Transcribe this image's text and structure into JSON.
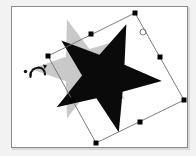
{
  "app": {
    "title": "Rotate Shape Canvas",
    "tool_mode": "Rotate",
    "canvas_background": "#ffffff",
    "page_background": "#f2f2f2",
    "frame_border_color": "#8a8a8a"
  },
  "canvas": {
    "width": 177,
    "height": 142,
    "label": "Drawing canvas"
  },
  "shapes": [
    {
      "id": "ghost-star",
      "name": "Original star preview",
      "type": "star",
      "points": 5,
      "fill": "#c9c9c9",
      "stroke": "none",
      "center_x": 71,
      "center_y": 62,
      "outer_radius": 52,
      "inner_radius": 21,
      "rotation_deg": -18,
      "state": "before-rotation"
    },
    {
      "id": "active-star",
      "name": "Rotated star",
      "type": "star",
      "points": 5,
      "fill": "#0a0a0a",
      "stroke": "none",
      "center_x": 93,
      "center_y": 70,
      "outer_radius": 57,
      "inner_radius": 23,
      "rotation_deg": 22,
      "state": "after-rotation"
    }
  ],
  "selection": {
    "label": "Rotated selection bounding box",
    "stroke": "#6e6e6e",
    "stroke_width": 0.9,
    "rotation_deg": 27,
    "handle_fill": "#000000",
    "handle_size": 5,
    "corners": [
      {
        "name": "top",
        "x": 123,
        "y": 6
      },
      {
        "name": "right",
        "x": 172,
        "y": 93
      },
      {
        "name": "bottom",
        "x": 84,
        "y": 136
      },
      {
        "name": "left",
        "x": 36,
        "y": 49
      }
    ],
    "handles": [
      {
        "name": "handle-top",
        "x": 123,
        "y": 6
      },
      {
        "name": "handle-top-right",
        "x": 148,
        "y": 50
      },
      {
        "name": "handle-right",
        "x": 172,
        "y": 93
      },
      {
        "name": "handle-bottom-right",
        "x": 128,
        "y": 115
      },
      {
        "name": "handle-bottom",
        "x": 84,
        "y": 136
      },
      {
        "name": "handle-bottom-left",
        "x": 60,
        "y": 93
      },
      {
        "name": "handle-left",
        "x": 36,
        "y": 49
      },
      {
        "name": "handle-top-left",
        "x": 79,
        "y": 27
      }
    ]
  },
  "rotation_center": {
    "name": "rotation-center-marker",
    "x": 131,
    "y": 25,
    "radius": 3,
    "stroke": "#707070",
    "fill": "none",
    "label": "Rotation pivot"
  },
  "cursor": {
    "name": "rotate-cursor",
    "x": 29,
    "y": 64,
    "label": "Rotate cursor",
    "glyph": "rotate-arrow",
    "color": "#111111",
    "dot_radius": 1.6
  },
  "status": {
    "visible": false,
    "text": ""
  }
}
